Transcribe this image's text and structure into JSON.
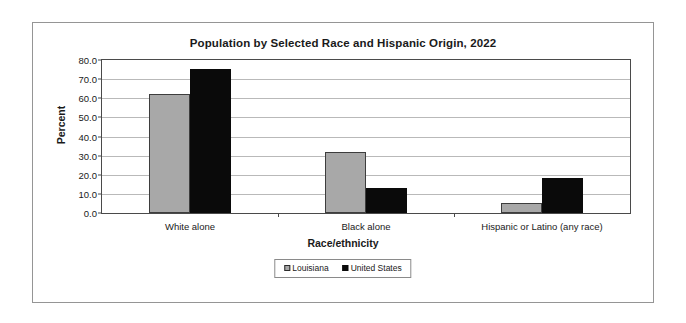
{
  "figure": {
    "title": "Population by Selected Race and Hispanic Origin, 2022"
  },
  "chart_data": {
    "type": "bar",
    "title": "Population by Selected Race and Hispanic Origin, 2022",
    "xlabel": "Race/ethnicity",
    "ylabel": "Percent",
    "categories": [
      "White alone",
      "Black alone",
      "Hispanic or Latino (any race)"
    ],
    "series": [
      {
        "name": "Louisiana",
        "color": "#a8a8a8",
        "values": [
          62.1,
          32.1,
          5.0
        ]
      },
      {
        "name": "United States",
        "color": "#0a0a0a",
        "values": [
          75.5,
          13.0,
          18.5
        ]
      }
    ],
    "ylim": [
      0.0,
      80.0
    ],
    "ytick_step": 10.0,
    "ytick_labels": [
      "0.0",
      "10.0",
      "20.0",
      "30.0",
      "40.0",
      "50.0",
      "60.0",
      "70.0",
      "80.0"
    ],
    "grid": "horizontal",
    "legend_position": "bottom"
  }
}
